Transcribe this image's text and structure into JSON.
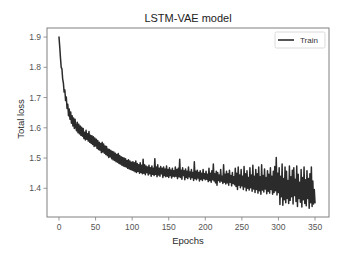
{
  "chart_data": {
    "type": "line",
    "title": "LSTM-VAE model",
    "xlabel": "Epochs",
    "ylabel": "Total loss",
    "xlim": [
      -16.4,
      369.1
    ],
    "ylim": [
      1.305,
      1.93
    ],
    "x_ticks": [
      0,
      50,
      100,
      150,
      200,
      250,
      300,
      350
    ],
    "x_tick_labels": [
      "0",
      "50",
      "100",
      "150",
      "200",
      "250",
      "300",
      "350"
    ],
    "y_ticks": [
      1.4,
      1.5,
      1.6,
      1.7,
      1.8,
      1.9
    ],
    "y_tick_labels": [
      "1.4",
      "1.5",
      "1.6",
      "1.7",
      "1.8",
      "1.9"
    ],
    "grid": false,
    "axis_color": "#808080",
    "legend": {
      "position": "top-right",
      "entries": [
        "Train"
      ]
    },
    "series": [
      {
        "name": "Train",
        "color": "#2b2b2b",
        "x_start": 0,
        "x_step": 1,
        "values": [
          1.9,
          1.868,
          1.832,
          1.8,
          1.795,
          1.762,
          1.748,
          1.718,
          1.725,
          1.69,
          1.702,
          1.664,
          1.678,
          1.64,
          1.662,
          1.628,
          1.652,
          1.615,
          1.64,
          1.606,
          1.632,
          1.598,
          1.628,
          1.602,
          1.59,
          1.618,
          1.584,
          1.612,
          1.58,
          1.606,
          1.575,
          1.602,
          1.572,
          1.598,
          1.565,
          1.585,
          1.56,
          1.592,
          1.562,
          1.58,
          1.556,
          1.588,
          1.552,
          1.575,
          1.548,
          1.574,
          1.545,
          1.57,
          1.538,
          1.566,
          1.54,
          1.562,
          1.532,
          1.558,
          1.528,
          1.552,
          1.526,
          1.548,
          1.518,
          1.552,
          1.52,
          1.546,
          1.516,
          1.54,
          1.512,
          1.538,
          1.508,
          1.53,
          1.502,
          1.528,
          1.504,
          1.525,
          1.498,
          1.522,
          1.494,
          1.52,
          1.492,
          1.516,
          1.488,
          1.512,
          1.486,
          1.515,
          1.482,
          1.508,
          1.48,
          1.504,
          1.476,
          1.502,
          1.474,
          1.5,
          1.472,
          1.498,
          1.47,
          1.492,
          1.466,
          1.494,
          1.464,
          1.49,
          1.462,
          1.486,
          1.46,
          1.488,
          1.458,
          1.484,
          1.455,
          1.49,
          1.452,
          1.482,
          1.456,
          1.478,
          1.45,
          1.484,
          1.452,
          1.476,
          1.448,
          1.496,
          1.45,
          1.478,
          1.445,
          1.474,
          1.452,
          1.47,
          1.444,
          1.476,
          1.448,
          1.468,
          1.44,
          1.474,
          1.446,
          1.466,
          1.442,
          1.498,
          1.446,
          1.47,
          1.438,
          1.478,
          1.444,
          1.466,
          1.44,
          1.472,
          1.448,
          1.466,
          1.436,
          1.47,
          1.442,
          1.464,
          1.438,
          1.474,
          1.44,
          1.462,
          1.436,
          1.468,
          1.442,
          1.46,
          1.434,
          1.466,
          1.44,
          1.458,
          1.438,
          1.47,
          1.44,
          1.462,
          1.432,
          1.466,
          1.438,
          1.496,
          1.436,
          1.46,
          1.43,
          1.468,
          1.442,
          1.458,
          1.428,
          1.464,
          1.436,
          1.456,
          1.432,
          1.47,
          1.438,
          1.454,
          1.43,
          1.462,
          1.436,
          1.452,
          1.426,
          1.488,
          1.432,
          1.456,
          1.428,
          1.46,
          1.434,
          1.452,
          1.424,
          1.458,
          1.43,
          1.45,
          1.426,
          1.462,
          1.432,
          1.448,
          1.428,
          1.456,
          1.43,
          1.446,
          1.422,
          1.466,
          1.426,
          1.45,
          1.42,
          1.458,
          1.428,
          1.48,
          1.424,
          1.448,
          1.418,
          1.456,
          1.41,
          1.452,
          1.426,
          1.444,
          1.42,
          1.462,
          1.424,
          1.44,
          1.416,
          1.478,
          1.42,
          1.446,
          1.414,
          1.456,
          1.418,
          1.448,
          1.41,
          1.46,
          1.42,
          1.442,
          1.408,
          1.452,
          1.416,
          1.438,
          1.412,
          1.466,
          1.406,
          1.45,
          1.396,
          1.47,
          1.41,
          1.444,
          1.402,
          1.462,
          1.408,
          1.44,
          1.396,
          1.472,
          1.404,
          1.448,
          1.392,
          1.458,
          1.4,
          1.436,
          1.394,
          1.468,
          1.402,
          1.444,
          1.39,
          1.476,
          1.398,
          1.44,
          1.386,
          1.462,
          1.396,
          1.448,
          1.384,
          1.47,
          1.392,
          1.438,
          1.38,
          1.478,
          1.394,
          1.442,
          1.388,
          1.464,
          1.398,
          1.436,
          1.382,
          1.458,
          1.39,
          1.446,
          1.384,
          1.468,
          1.396,
          1.44,
          1.38,
          1.456,
          1.386,
          1.472,
          1.392,
          1.502,
          1.378,
          1.45,
          1.386,
          1.468,
          1.346,
          1.44,
          1.372,
          1.48,
          1.344,
          1.432,
          1.362,
          1.47,
          1.352,
          1.456,
          1.366,
          1.426,
          1.35,
          1.474,
          1.36,
          1.438,
          1.372,
          1.46,
          1.348,
          1.468,
          1.376,
          1.43,
          1.356,
          1.474,
          1.34,
          1.446,
          1.366,
          1.42,
          1.354,
          1.462,
          1.338,
          1.436,
          1.362,
          1.47,
          1.35,
          1.428,
          1.342,
          1.458,
          1.366,
          1.432,
          1.334,
          1.448,
          1.352,
          1.47,
          1.34,
          1.424,
          1.348,
          1.396,
          1.352
        ]
      }
    ]
  }
}
